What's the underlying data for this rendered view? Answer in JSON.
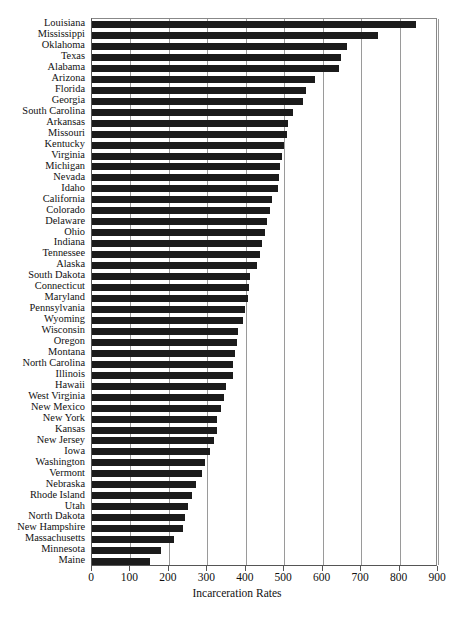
{
  "chart_data": {
    "type": "bar",
    "orientation": "horizontal",
    "title": "",
    "xlabel": "Incarceration Rates",
    "ylabel": "",
    "xlim": [
      0,
      900
    ],
    "ylim": null,
    "grid": true,
    "legend": null,
    "xticks": [
      0,
      100,
      200,
      300,
      400,
      500,
      600,
      700,
      800,
      900
    ],
    "xticklabels": [
      "0",
      "100",
      "200",
      "300",
      "400",
      "500",
      "600",
      "700",
      "800",
      "900"
    ],
    "categories": [
      "Louisiana",
      "Mississippi",
      "Oklahoma",
      "Texas",
      "Alabama",
      "Arizona",
      "Florida",
      "Georgia",
      "South Carolina",
      "Arkansas",
      "Missouri",
      "Kentucky",
      "Virginia",
      "Michigan",
      "Nevada",
      "Idaho",
      "California",
      "Colorado",
      "Delaware",
      "Ohio",
      "Indiana",
      "Tennessee",
      "Alaska",
      "South Dakota",
      "Connecticut",
      "Maryland",
      "Pennsylvania",
      "Wyoming",
      "Wisconsin",
      "Oregon",
      "Montana",
      "North Carolina",
      "Illinois",
      "Hawaii",
      "West Virginia",
      "New Mexico",
      "New York",
      "Kansas",
      "New Jersey",
      "Iowa",
      "Washington",
      "Vermont",
      "Nebraska",
      "Rhode Island",
      "Utah",
      "North Dakota",
      "New Hampshire",
      "Massachusetts",
      "Minnesota",
      "Maine"
    ],
    "values": [
      843,
      744,
      664,
      648,
      643,
      580,
      557,
      549,
      522,
      509,
      506,
      500,
      495,
      490,
      486,
      484,
      467,
      464,
      455,
      449,
      442,
      436,
      430,
      412,
      408,
      405,
      398,
      394,
      380,
      376,
      372,
      368,
      366,
      348,
      343,
      336,
      325,
      324,
      318,
      307,
      293,
      286,
      270,
      259,
      251,
      241,
      238,
      213,
      179,
      151
    ],
    "bar_color": "#1b1b1b"
  },
  "axis": {
    "x_title": "Incarceration Rates"
  },
  "caption": ""
}
